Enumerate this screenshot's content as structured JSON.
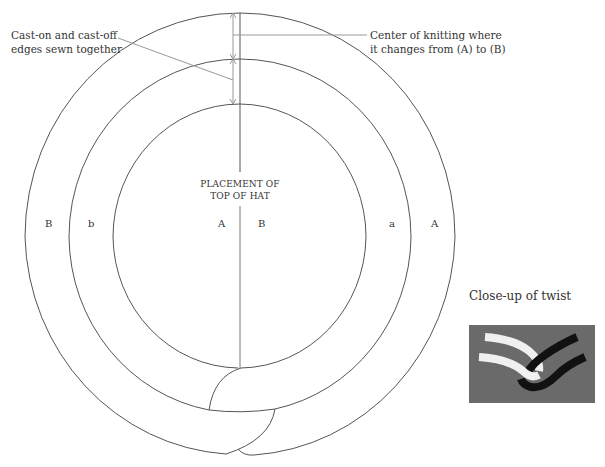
{
  "annotations": {
    "left_callout": [
      "Cast-on and cast-off",
      "edges sewn together"
    ],
    "right_callout": [
      "Center of knitting where",
      "it changes from (A) to (B)"
    ],
    "center_label": [
      "PLACEMENT OF",
      "TOP OF HAT"
    ]
  },
  "ring_labels": {
    "left_outer": "B",
    "left_middle": "b",
    "left_inner": "A",
    "right_inner": "B",
    "right_middle": "a",
    "right_outer": "A"
  },
  "closeup": {
    "title": "Close-up of twist",
    "background_color": "#6a6a6a",
    "strand_light_color": "#f2f2f2",
    "strand_dark_color": "#111111"
  },
  "colors": {
    "line": "#555555",
    "leader": "#999999"
  }
}
